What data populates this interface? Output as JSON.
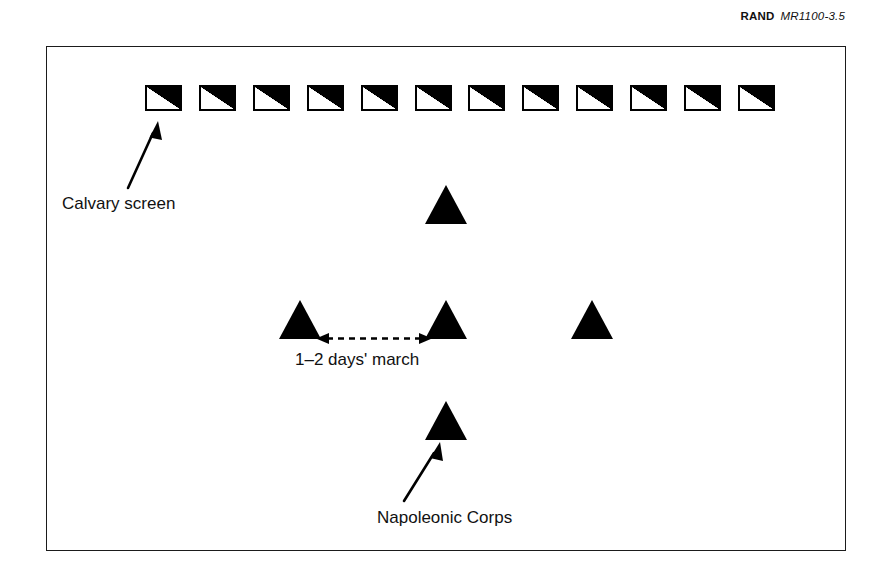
{
  "figure": {
    "source": {
      "organization": "RAND",
      "identifier": "MR1100-3.5"
    },
    "cavalry_screen": {
      "label": "Calvary screen",
      "symbol_name": "cavalry-unit-symbol",
      "symbol_count": 12,
      "symbols": [
        "cavalry-symbol-1",
        "cavalry-symbol-2",
        "cavalry-symbol-3",
        "cavalry-symbol-4",
        "cavalry-symbol-5",
        "cavalry-symbol-6",
        "cavalry-symbol-7",
        "cavalry-symbol-8",
        "cavalry-symbol-9",
        "cavalry-symbol-10",
        "cavalry-symbol-11",
        "cavalry-symbol-12"
      ]
    },
    "corps": {
      "label": "Napoleonic Corps",
      "count": 5,
      "units": [
        {
          "name": "corps-unit-top",
          "x": 446,
          "y": 224
        },
        {
          "name": "corps-unit-middle-left",
          "x": 300,
          "y": 339
        },
        {
          "name": "corps-unit-middle-center",
          "x": 446,
          "y": 339
        },
        {
          "name": "corps-unit-middle-right",
          "x": 592,
          "y": 339
        },
        {
          "name": "corps-unit-bottom",
          "x": 446,
          "y": 440
        }
      ]
    },
    "spacing_annotation": {
      "label": "1–2 days' march",
      "arrow_name": "spacing-double-arrow",
      "from_x": 318,
      "to_x": 430,
      "y": 338
    },
    "colors": {
      "ink": "#000000",
      "text": "#111111",
      "frame": "#1b1b1b",
      "background": "#ffffff"
    }
  }
}
